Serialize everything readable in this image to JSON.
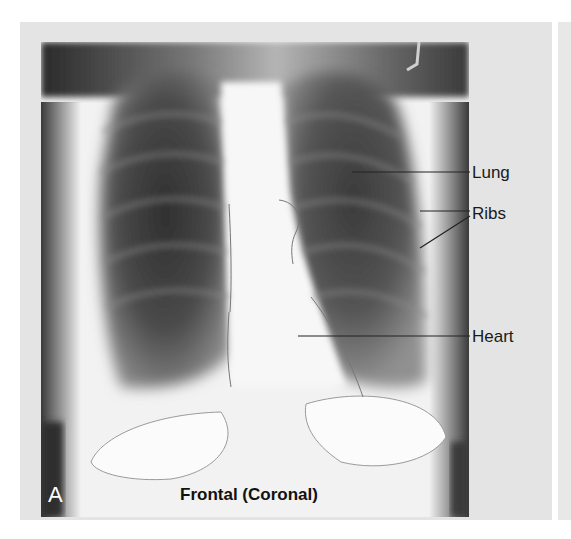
{
  "figure": {
    "panel_letter": "A",
    "caption": "Frontal (Coronal)",
    "labels": [
      {
        "text": "Lung"
      },
      {
        "text": "Ribs"
      },
      {
        "text": "Heart"
      }
    ],
    "colors": {
      "panel_background": "#e4e4e4",
      "label_text": "#1a1a1a",
      "leader_line": "#222222"
    }
  }
}
